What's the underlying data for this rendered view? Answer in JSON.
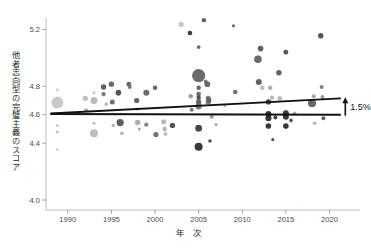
{
  "chart_data": {
    "type": "scatter",
    "title": "",
    "xlabel": "年 次",
    "ylabel": "他者志向型の完璧主義のスコア",
    "xlim": [
      1987.5,
      2023.5
    ],
    "ylim": [
      3.93,
      5.28
    ],
    "xticks": [
      1990,
      1995,
      2000,
      2005,
      2010,
      2015,
      2020
    ],
    "xtick_labels": [
      "1990",
      "1995",
      "2000",
      "2005",
      "2010",
      "2015",
      "2020"
    ],
    "yticks": [
      5.2,
      4.8,
      4.6,
      4.4,
      4.0
    ],
    "ytick_labels": [
      "5.2",
      "4.8",
      "4.6",
      "4.4",
      "4.0"
    ],
    "grid": false,
    "legend": null,
    "annotations": [
      {
        "name": "increase-label",
        "text": "1.5%",
        "x": 2022.0,
        "y": 4.7
      }
    ],
    "trend_lines": [
      {
        "name": "regression-trend",
        "x0": 1988.0,
        "y0": 4.608,
        "x1": 2021.3,
        "y1": 4.715
      },
      {
        "name": "baseline-flat",
        "x0": 1988.0,
        "y0": 4.605,
        "x1": 2021.3,
        "y1": 4.6
      }
    ],
    "point_color_levels": [
      "#2e2e2e",
      "#585858",
      "#8a8a8a",
      "#b8b8b8",
      "#d6d6d6"
    ],
    "points": [
      {
        "x": 1988.8,
        "y": 4.775,
        "r": 1.5,
        "c": "#c9c9c9"
      },
      {
        "x": 1988.8,
        "y": 4.685,
        "r": 6.0,
        "c": "#c3c3c3"
      },
      {
        "x": 1988.8,
        "y": 4.478,
        "r": 1.6,
        "c": "#bdbdbd"
      },
      {
        "x": 1988.8,
        "y": 4.355,
        "r": 1.4,
        "c": "#c5c5c5"
      },
      {
        "x": 1988.8,
        "y": 4.525,
        "r": 1.5,
        "c": "#bfbfbf"
      },
      {
        "x": 1992.0,
        "y": 4.715,
        "r": 2.6,
        "c": "#b4b4b4"
      },
      {
        "x": 1992.1,
        "y": 4.632,
        "r": 2.0,
        "c": "#9a9a9a"
      },
      {
        "x": 1993.0,
        "y": 4.7,
        "r": 3.4,
        "c": "#b0b0b0"
      },
      {
        "x": 1993.0,
        "y": 4.755,
        "r": 1.6,
        "c": "#c0c0c0"
      },
      {
        "x": 1993.0,
        "y": 4.54,
        "r": 1.6,
        "c": "#b9b9b9"
      },
      {
        "x": 1993.0,
        "y": 4.47,
        "r": 4.0,
        "c": "#b6b6b6"
      },
      {
        "x": 1994.1,
        "y": 4.795,
        "r": 2.7,
        "c": "#4a4a4a"
      },
      {
        "x": 1994.1,
        "y": 4.745,
        "r": 2.2,
        "c": "#6a6a6a"
      },
      {
        "x": 1994.4,
        "y": 4.675,
        "r": 1.6,
        "c": "#a0a0a0"
      },
      {
        "x": 1995.0,
        "y": 4.815,
        "r": 2.7,
        "c": "#555555"
      },
      {
        "x": 1995.1,
        "y": 4.69,
        "r": 2.5,
        "c": "#5f5f5f"
      },
      {
        "x": 1995.2,
        "y": 4.525,
        "r": 1.7,
        "c": "#a8a8a8"
      },
      {
        "x": 1995.8,
        "y": 4.755,
        "r": 2.8,
        "c": "#3c3c3c"
      },
      {
        "x": 1996.0,
        "y": 4.545,
        "r": 3.6,
        "c": "#464646"
      },
      {
        "x": 1996.2,
        "y": 4.47,
        "r": 1.7,
        "c": "#a5a5a5"
      },
      {
        "x": 1997.0,
        "y": 4.815,
        "r": 2.4,
        "c": "#555555"
      },
      {
        "x": 1997.1,
        "y": 4.795,
        "r": 2.0,
        "c": "#6b6b6b"
      },
      {
        "x": 1997.9,
        "y": 4.7,
        "r": 2.6,
        "c": "#4e4e4e"
      },
      {
        "x": 1998.0,
        "y": 4.64,
        "r": 1.6,
        "c": "#8f8f8f"
      },
      {
        "x": 1998.0,
        "y": 4.545,
        "r": 2.7,
        "c": "#a2a2a2"
      },
      {
        "x": 1998.2,
        "y": 4.5,
        "r": 1.5,
        "c": "#9c9c9c"
      },
      {
        "x": 1999.0,
        "y": 4.755,
        "r": 3.0,
        "c": "#575757"
      },
      {
        "x": 1999.0,
        "y": 4.53,
        "r": 2.2,
        "c": "#7d7d7d"
      },
      {
        "x": 2000.0,
        "y": 4.79,
        "r": 2.2,
        "c": "#4d4d4d"
      },
      {
        "x": 2000.1,
        "y": 4.46,
        "r": 2.6,
        "c": "#626262"
      },
      {
        "x": 2001.0,
        "y": 4.55,
        "r": 2.6,
        "c": "#b0b0b0"
      },
      {
        "x": 2001.1,
        "y": 4.5,
        "r": 2.2,
        "c": "#a7a7a7"
      },
      {
        "x": 2001.2,
        "y": 4.465,
        "r": 2.0,
        "c": "#b2b2b2"
      },
      {
        "x": 2002.0,
        "y": 4.525,
        "r": 2.7,
        "c": "#3f3f3f"
      },
      {
        "x": 2003.0,
        "y": 5.235,
        "r": 2.6,
        "c": "#c2c2c2"
      },
      {
        "x": 2004.0,
        "y": 5.175,
        "r": 2.3,
        "c": "#222222"
      },
      {
        "x": 2004.1,
        "y": 4.73,
        "r": 2.2,
        "c": "#8d8d8d"
      },
      {
        "x": 2004.2,
        "y": 4.635,
        "r": 2.0,
        "c": "#666666"
      },
      {
        "x": 2005.0,
        "y": 5.075,
        "r": 1.8,
        "c": "#555555"
      },
      {
        "x": 2005.0,
        "y": 4.875,
        "r": 6.6,
        "c": "#555555"
      },
      {
        "x": 2005.0,
        "y": 4.79,
        "r": 2.2,
        "c": "#4e4e4e"
      },
      {
        "x": 2005.0,
        "y": 4.745,
        "r": 2.4,
        "c": "#5a5a5a"
      },
      {
        "x": 2005.0,
        "y": 4.72,
        "r": 2.2,
        "c": "#3a3a3a"
      },
      {
        "x": 2005.0,
        "y": 4.69,
        "r": 2.6,
        "c": "#4a4a4a"
      },
      {
        "x": 2005.0,
        "y": 4.66,
        "r": 3.2,
        "c": "#6e6e6e"
      },
      {
        "x": 2005.0,
        "y": 4.505,
        "r": 3.4,
        "c": "#2d2d2d"
      },
      {
        "x": 2005.0,
        "y": 4.375,
        "r": 4.0,
        "c": "#1f1f1f"
      },
      {
        "x": 2005.6,
        "y": 5.265,
        "r": 2.2,
        "c": "#4f4f4f"
      },
      {
        "x": 2005.8,
        "y": 4.835,
        "r": 1.9,
        "c": "#707070"
      },
      {
        "x": 2006.0,
        "y": 4.815,
        "r": 2.9,
        "c": "#595959"
      },
      {
        "x": 2006.1,
        "y": 4.715,
        "r": 2.6,
        "c": "#666666"
      },
      {
        "x": 2006.1,
        "y": 4.69,
        "r": 2.6,
        "c": "#6a6a6a"
      },
      {
        "x": 2006.2,
        "y": 4.7,
        "r": 2.4,
        "c": "#5e5e5e"
      },
      {
        "x": 2006.3,
        "y": 4.415,
        "r": 1.8,
        "c": "#3a3a3a"
      },
      {
        "x": 2006.5,
        "y": 4.585,
        "r": 2.0,
        "c": "#888888"
      },
      {
        "x": 2007.0,
        "y": 4.53,
        "r": 1.4,
        "c": "#8c8c8c"
      },
      {
        "x": 2008.0,
        "y": 4.665,
        "r": 1.6,
        "c": "#a6a6a6"
      },
      {
        "x": 2009.0,
        "y": 5.225,
        "r": 1.6,
        "c": "#555555"
      },
      {
        "x": 2009.2,
        "y": 4.76,
        "r": 2.3,
        "c": "#5d5d5d"
      },
      {
        "x": 2011.8,
        "y": 4.99,
        "r": 3.8,
        "c": "#555555"
      },
      {
        "x": 2011.9,
        "y": 4.83,
        "r": 3.0,
        "c": "#4e4e4e"
      },
      {
        "x": 2012.1,
        "y": 5.065,
        "r": 2.8,
        "c": "#4a4a4a"
      },
      {
        "x": 2012.3,
        "y": 4.79,
        "r": 2.2,
        "c": "#b2b2b2"
      },
      {
        "x": 2013.0,
        "y": 4.69,
        "r": 2.7,
        "c": "#2e2e2e"
      },
      {
        "x": 2013.0,
        "y": 4.605,
        "r": 3.0,
        "c": "#1d1d1d"
      },
      {
        "x": 2013.0,
        "y": 4.575,
        "r": 3.0,
        "c": "#1d1d1d"
      },
      {
        "x": 2013.0,
        "y": 4.52,
        "r": 2.8,
        "c": "#1d1d1d"
      },
      {
        "x": 2013.2,
        "y": 4.79,
        "r": 2.2,
        "c": "#a3a3a3"
      },
      {
        "x": 2013.4,
        "y": 4.72,
        "r": 2.2,
        "c": "#b0b0b0"
      },
      {
        "x": 2013.5,
        "y": 4.425,
        "r": 1.6,
        "c": "#3a3a3a"
      },
      {
        "x": 2013.8,
        "y": 4.58,
        "r": 2.0,
        "c": "#2a2a2a"
      },
      {
        "x": 2014.2,
        "y": 4.895,
        "r": 2.7,
        "c": "#4c4c4c"
      },
      {
        "x": 2014.3,
        "y": 4.715,
        "r": 2.4,
        "c": "#b4b4b4"
      },
      {
        "x": 2015.0,
        "y": 5.04,
        "r": 2.4,
        "c": "#3d3d3d"
      },
      {
        "x": 2015.0,
        "y": 4.61,
        "r": 3.0,
        "c": "#1d1d1d"
      },
      {
        "x": 2015.0,
        "y": 4.585,
        "r": 3.0,
        "c": "#1d1d1d"
      },
      {
        "x": 2015.0,
        "y": 4.52,
        "r": 2.8,
        "c": "#1d1d1d"
      },
      {
        "x": 2015.6,
        "y": 4.56,
        "r": 1.8,
        "c": "#3a3a3a"
      },
      {
        "x": 2016.0,
        "y": 4.61,
        "r": 1.8,
        "c": "#a0a0a0"
      },
      {
        "x": 2017.8,
        "y": 4.69,
        "r": 2.0,
        "c": "#8e8e8e"
      },
      {
        "x": 2018.0,
        "y": 4.68,
        "r": 4.0,
        "c": "#555555"
      },
      {
        "x": 2018.2,
        "y": 4.73,
        "r": 2.0,
        "c": "#9b9b9b"
      },
      {
        "x": 2018.3,
        "y": 4.54,
        "r": 1.8,
        "c": "#aaaaaa"
      },
      {
        "x": 2019.0,
        "y": 5.155,
        "r": 2.7,
        "c": "#3e3e3e"
      },
      {
        "x": 2019.1,
        "y": 4.795,
        "r": 2.0,
        "c": "#707070"
      },
      {
        "x": 2019.2,
        "y": 4.725,
        "r": 2.0,
        "c": "#8a8a8a"
      },
      {
        "x": 2019.3,
        "y": 4.575,
        "r": 2.0,
        "c": "#4a4a4a"
      }
    ]
  },
  "axis": {
    "spine_color": "#bcbcbc",
    "tick_color": "#9a9a9a",
    "line_color": "#111111"
  },
  "caption": {
    "text": ""
  }
}
